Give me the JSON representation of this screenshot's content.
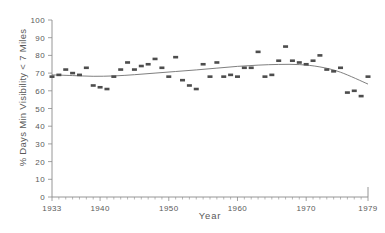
{
  "chart_data": {
    "type": "scatter",
    "title": "",
    "xlabel": "Year",
    "ylabel": "% Days Min Visibility < 7 Miles",
    "xlim": [
      1933,
      1979
    ],
    "ylim": [
      0,
      100
    ],
    "grid": false,
    "legend": null,
    "y_ticks": [
      0,
      10,
      20,
      30,
      40,
      50,
      60,
      70,
      80,
      90,
      100
    ],
    "y_tick_labels": [
      "0",
      "10",
      "20",
      "30",
      "40",
      "50",
      "60",
      "70",
      "80",
      "90",
      "100"
    ],
    "x_ticks": [
      1933,
      1940,
      1950,
      1960,
      1970,
      1979
    ],
    "x_tick_labels": [
      "1933",
      "1940",
      "1950",
      "1960",
      "1970",
      "1979"
    ],
    "x_minor_tick_step": 1,
    "marker_style": "filled-rectangle",
    "marker_color": "#4d4d4d",
    "trend_color": "#707070",
    "x": [
      1933,
      1934,
      1935,
      1936,
      1937,
      1938,
      1939,
      1940,
      1941,
      1942,
      1943,
      1944,
      1945,
      1946,
      1947,
      1948,
      1949,
      1950,
      1951,
      1952,
      1953,
      1954,
      1955,
      1956,
      1957,
      1958,
      1959,
      1960,
      1961,
      1962,
      1963,
      1964,
      1965,
      1966,
      1967,
      1968,
      1969,
      1970,
      1971,
      1972,
      1973,
      1974,
      1975,
      1976,
      1977,
      1978,
      1979
    ],
    "values": [
      68,
      69,
      72,
      70,
      69,
      73,
      63,
      62,
      61,
      68,
      72,
      76,
      72,
      74,
      75,
      78,
      73,
      68,
      79,
      66,
      63,
      61,
      75,
      68,
      76,
      68,
      69,
      68,
      73,
      73,
      82,
      68,
      69,
      77,
      85,
      77,
      76,
      75,
      77,
      80,
      72,
      71,
      73,
      59,
      60,
      57,
      68
    ],
    "trend_x": [
      1933,
      1936,
      1939,
      1942,
      1945,
      1948,
      1951,
      1954,
      1957,
      1960,
      1963,
      1966,
      1969,
      1972,
      1975,
      1979
    ],
    "trend_y": [
      69.0,
      68.6,
      68.2,
      68.4,
      69.1,
      70.0,
      70.9,
      71.8,
      72.8,
      73.8,
      74.5,
      74.9,
      74.8,
      73.5,
      70.5,
      63.8
    ]
  },
  "axes": {
    "y_title": "% Days Min Visibility < 7 Miles",
    "x_title": "Year"
  }
}
